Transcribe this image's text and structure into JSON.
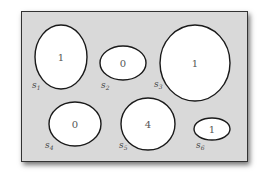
{
  "diagram": {
    "background": "#d9d9d9",
    "sets": [
      {
        "id": "s1",
        "label": "s",
        "subscript": "1",
        "count": "1",
        "cx": 61,
        "cy": 57,
        "rx": 26,
        "ry": 32,
        "lx": 32,
        "ly": 88
      },
      {
        "id": "s2",
        "label": "s",
        "subscript": "2",
        "count": "0",
        "cx": 123,
        "cy": 63,
        "rx": 23,
        "ry": 17,
        "lx": 101,
        "ly": 88
      },
      {
        "id": "s3",
        "label": "s",
        "subscript": "3",
        "count": "1",
        "cx": 195,
        "cy": 63,
        "rx": 35,
        "ry": 38,
        "lx": 154,
        "ly": 87
      },
      {
        "id": "s4",
        "label": "s",
        "subscript": "4",
        "count": "0",
        "cx": 75,
        "cy": 124,
        "rx": 26,
        "ry": 22,
        "lx": 45,
        "ly": 148
      },
      {
        "id": "s5",
        "label": "s",
        "subscript": "5",
        "count": "4",
        "cx": 148,
        "cy": 124,
        "rx": 27,
        "ry": 26,
        "lx": 119,
        "ly": 148
      },
      {
        "id": "s6",
        "label": "s",
        "subscript": "6",
        "count": "1",
        "cx": 212,
        "cy": 129,
        "rx": 18,
        "ry": 11,
        "lx": 196,
        "ly": 148
      }
    ]
  }
}
